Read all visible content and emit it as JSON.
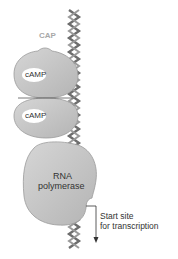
{
  "diagram": {
    "labels": {
      "cap": "CAP",
      "camp_top": "cAMP",
      "camp_bottom": "cAMP",
      "rna_polymerase_line1": "RNA",
      "rna_polymerase_line2": "polymerase",
      "start_site_line1": "Start site",
      "start_site_line2": "for transcription"
    },
    "colors": {
      "protein_fill": "#c4c4c4",
      "protein_outline": "#9a9a9a",
      "camp_fill": "#ffffff",
      "dna_strand": "#6e6e6e",
      "cap_label": "#a8a8a8",
      "text": "#333333"
    }
  }
}
